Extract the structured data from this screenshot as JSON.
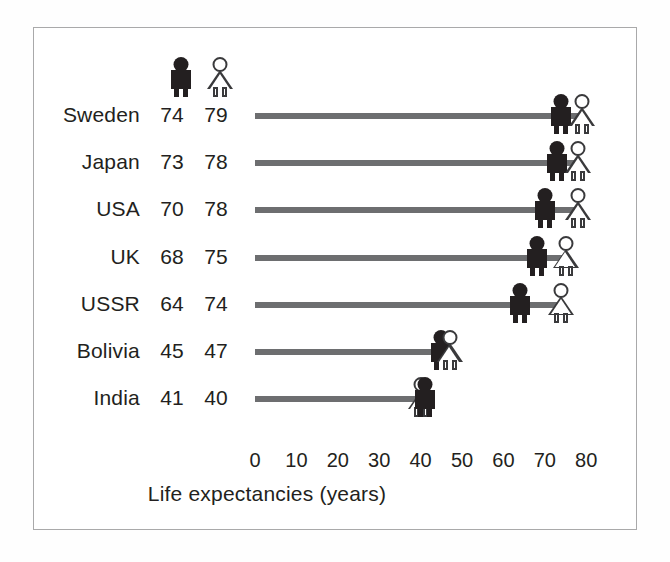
{
  "chart_data": {
    "type": "bar",
    "subtype": "dumbbell",
    "title": "",
    "xlabel": "Life expectancies (years)",
    "ylabel": "",
    "xlim": [
      0,
      80
    ],
    "xticks": [
      0,
      10,
      20,
      30,
      40,
      50,
      60,
      70,
      80
    ],
    "xtick_labels": [
      "0",
      "10",
      "20",
      "30",
      "40",
      "50",
      "60",
      "70",
      "80"
    ],
    "grid": false,
    "legend_position": "top-inside-left",
    "categories": [
      "Sweden",
      "Japan",
      "USA",
      "UK",
      "USSR",
      "Bolivia",
      "India"
    ],
    "series": [
      {
        "name": "male",
        "icon": "male-figure-icon",
        "color": "#231f20",
        "values": [
          74,
          73,
          70,
          68,
          64,
          45,
          41
        ]
      },
      {
        "name": "female",
        "icon": "female-figure-icon",
        "color": "#ffffff",
        "values": [
          79,
          78,
          78,
          75,
          74,
          47,
          40
        ]
      }
    ],
    "rows": [
      {
        "label": "Sweden",
        "male": 74,
        "female": 79
      },
      {
        "label": "Japan",
        "male": 73,
        "female": 78
      },
      {
        "label": "USA",
        "male": 70,
        "female": 78
      },
      {
        "label": "UK",
        "male": 68,
        "female": 75
      },
      {
        "label": "USSR",
        "male": 64,
        "female": 74
      },
      {
        "label": "Bolivia",
        "male": 45,
        "female": 47
      },
      {
        "label": "India",
        "male": 41,
        "female": 40
      }
    ],
    "line_color": "#6d6e70"
  },
  "legend": {
    "male_icon": "male-figure-icon",
    "female_icon": "female-figure-icon"
  },
  "axis": {
    "title": "Life expectancies (years)",
    "ticks": [
      "0",
      "10",
      "20",
      "30",
      "40",
      "50",
      "60",
      "70",
      "80"
    ]
  },
  "colors": {
    "male": "#231f20",
    "female": "#ffffff",
    "female_outline": "#3a3a3c",
    "line": "#6d6e70",
    "frame": "#a9a9aa",
    "text": "#231f20",
    "background": "#ffffff"
  }
}
